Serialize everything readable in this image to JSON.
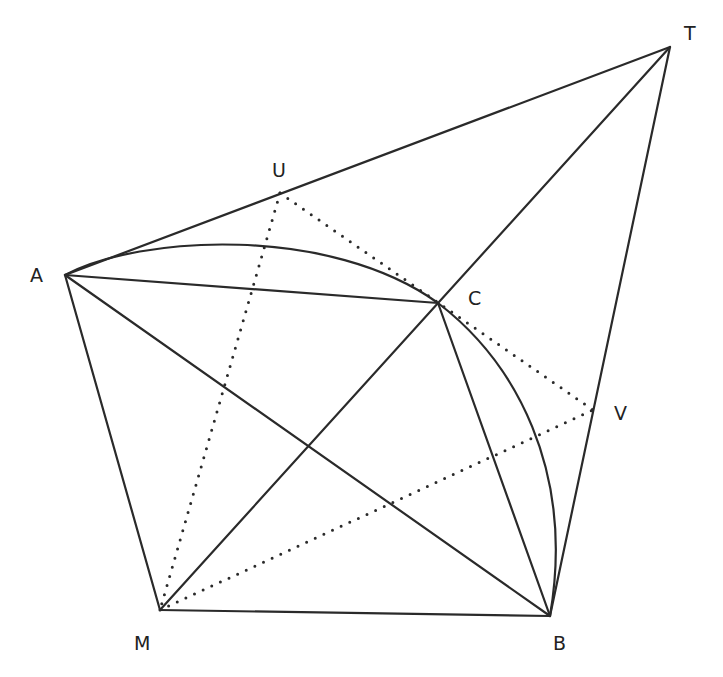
{
  "diagram": {
    "type": "geometry-figure",
    "points": {
      "A": {
        "label": "A",
        "x": 65,
        "y": 275,
        "label_x": 30,
        "label_y": 282
      },
      "T": {
        "label": "T",
        "x": 670,
        "y": 47,
        "label_x": 684,
        "label_y": 40
      },
      "U": {
        "label": "U",
        "x": 280,
        "y": 193,
        "label_x": 272,
        "label_y": 177
      },
      "C": {
        "label": "C",
        "x": 438,
        "y": 303,
        "label_x": 468,
        "label_y": 305
      },
      "V": {
        "label": "V",
        "x": 593,
        "y": 410,
        "label_x": 614,
        "label_y": 420
      },
      "M": {
        "label": "M",
        "x": 160,
        "y": 610,
        "label_x": 134,
        "label_y": 650
      },
      "B": {
        "label": "B",
        "x": 550,
        "y": 616,
        "label_x": 553,
        "label_y": 650
      }
    },
    "solid_segments": [
      [
        "A",
        "T"
      ],
      [
        "T",
        "M"
      ],
      [
        "T",
        "B"
      ],
      [
        "A",
        "C"
      ],
      [
        "A",
        "B"
      ],
      [
        "A",
        "M"
      ],
      [
        "M",
        "B"
      ],
      [
        "C",
        "B"
      ]
    ],
    "dotted_segments": [
      [
        "U",
        "M"
      ],
      [
        "U",
        "V"
      ],
      [
        "M",
        "V"
      ]
    ],
    "arc": {
      "from": "A",
      "through": "C",
      "to": "B"
    },
    "colors": {
      "stroke": "#2a2a2a",
      "background": "#ffffff"
    }
  }
}
